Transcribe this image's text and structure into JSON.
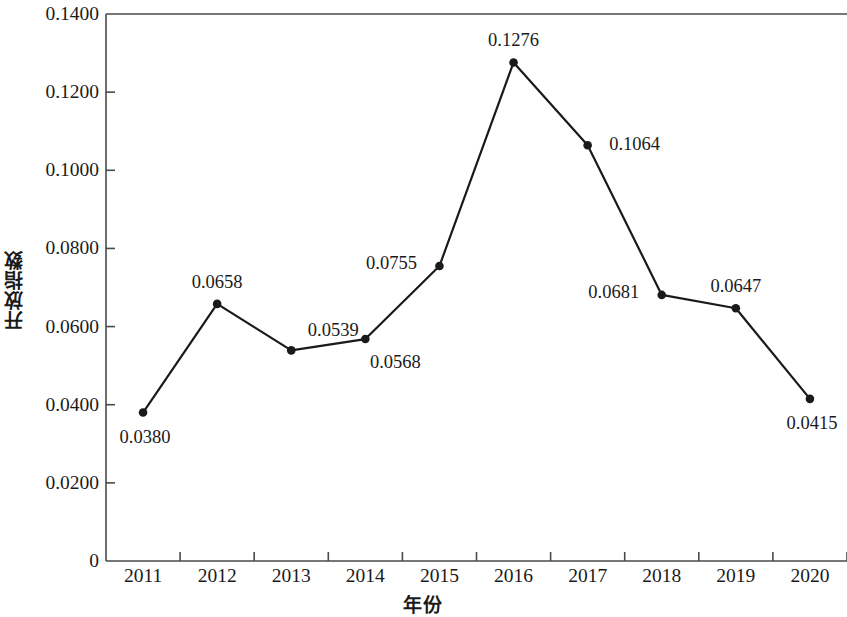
{
  "chart_data": {
    "type": "line",
    "title": "",
    "xlabel": "年份",
    "ylabel": "开放指数",
    "categories": [
      "2011",
      "2012",
      "2013",
      "2014",
      "2015",
      "2016",
      "2017",
      "2018",
      "2019",
      "2020"
    ],
    "values": [
      0.038,
      0.0658,
      0.0539,
      0.0568,
      0.0755,
      0.1276,
      0.1064,
      0.0681,
      0.0647,
      0.0415
    ],
    "point_labels": [
      "0.0380",
      "0.0658",
      "0.0539",
      "0.0568",
      "0.0755",
      "0.1276",
      "0.1064",
      "0.0681",
      "0.0647",
      "0.0415"
    ],
    "label_positions": [
      "below",
      "above",
      "above-right",
      "below-right",
      "left",
      "above",
      "right",
      "left",
      "above",
      "below"
    ],
    "ylim": [
      0,
      0.14
    ],
    "yticks": [
      0,
      0.02,
      0.04,
      0.06,
      0.08,
      0.1,
      0.12,
      0.14
    ],
    "ytick_labels": [
      "0",
      "0.0200",
      "0.0400",
      "0.0600",
      "0.0800",
      "0.1000",
      "0.1200",
      "0.1400"
    ],
    "grid": false,
    "legend": null,
    "series_color": "#1a1a1a",
    "marker": "circle",
    "marker_size": 7,
    "line_width": 2.2
  }
}
